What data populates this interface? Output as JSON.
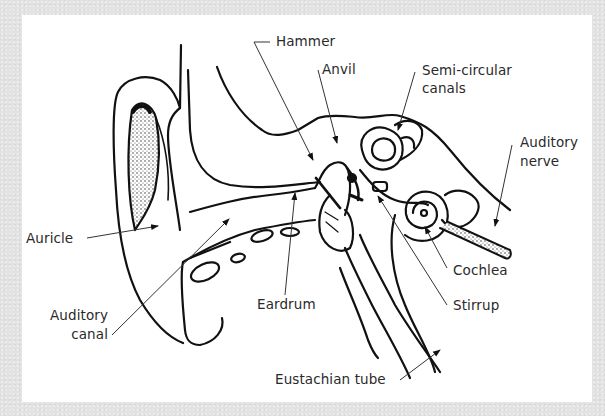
{
  "diagram": {
    "labels": {
      "hammer": "Hammer",
      "anvil": "Anvil",
      "semicircular_1": "Semi-circular",
      "semicircular_2": "canals",
      "auditory_nerve_1": "Auditory",
      "auditory_nerve_2": "nerve",
      "auricle": "Auricle",
      "auditory_canal_1": "Auditory",
      "auditory_canal_2": "canal",
      "eardrum": "Eardrum",
      "cochlea": "Cochlea",
      "stirrup": "Stirrup",
      "eustachian_tube": "Eustachian tube"
    },
    "colors": {
      "background": "#e2e2e2",
      "panel": "#ffffff",
      "ink": "#111111",
      "label": "#2a2a2a"
    }
  }
}
